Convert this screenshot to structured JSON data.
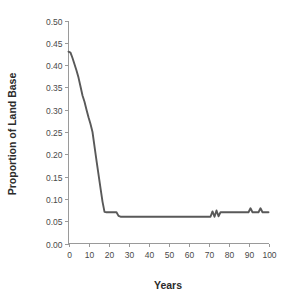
{
  "chart_data": {
    "type": "line",
    "title": "",
    "subtitle": "",
    "xlabel": "Years",
    "ylabel": "Proportion of Land Base",
    "xlim": [
      0,
      100
    ],
    "ylim": [
      0,
      0.5
    ],
    "grid": false,
    "legend": false,
    "legend_position": "none",
    "line_color": "#595959",
    "background_color": "#ffffff",
    "axis_color": "#9a9a9a",
    "x_ticks": [
      0,
      10,
      20,
      30,
      40,
      50,
      60,
      70,
      80,
      90,
      100
    ],
    "x_tick_labels": [
      "0",
      "10",
      "20",
      "30",
      "40",
      "50",
      "60",
      "70",
      "80",
      "90",
      "100"
    ],
    "y_ticks": [
      0.0,
      0.05,
      0.1,
      0.15,
      0.2,
      0.25,
      0.3,
      0.35,
      0.4,
      0.45,
      0.5
    ],
    "y_tick_labels": [
      "0.00",
      "0.05",
      "0.10",
      "0.15",
      "0.20",
      "0.25",
      "0.30",
      "0.35",
      "0.40",
      "0.45",
      "0.50"
    ],
    "series": [
      {
        "name": "Proportion of Land Base",
        "color": "#595959",
        "x": [
          0,
          1,
          2,
          3,
          4,
          5,
          6,
          7,
          8,
          9,
          10,
          11,
          12,
          13,
          14,
          15,
          16,
          17,
          18,
          19,
          20,
          21,
          22,
          23,
          24,
          25,
          26,
          27,
          28,
          29,
          30,
          35,
          40,
          45,
          50,
          55,
          60,
          65,
          70,
          71,
          72,
          73,
          74,
          75,
          76,
          77,
          78,
          80,
          85,
          90,
          91,
          92,
          93,
          94,
          95,
          96,
          97,
          98,
          100
        ],
        "values": [
          0.43,
          0.428,
          0.416,
          0.402,
          0.388,
          0.372,
          0.352,
          0.332,
          0.318,
          0.3,
          0.283,
          0.268,
          0.25,
          0.218,
          0.186,
          0.155,
          0.124,
          0.094,
          0.071,
          0.07,
          0.07,
          0.07,
          0.07,
          0.07,
          0.07,
          0.062,
          0.06,
          0.06,
          0.06,
          0.06,
          0.06,
          0.06,
          0.06,
          0.06,
          0.06,
          0.06,
          0.06,
          0.06,
          0.06,
          0.06,
          0.072,
          0.06,
          0.074,
          0.061,
          0.07,
          0.07,
          0.07,
          0.07,
          0.07,
          0.07,
          0.079,
          0.07,
          0.07,
          0.07,
          0.07,
          0.079,
          0.07,
          0.07,
          0.07
        ]
      }
    ]
  },
  "axes": {
    "x_title": "Years",
    "y_title": "Proportion of Land Base"
  }
}
